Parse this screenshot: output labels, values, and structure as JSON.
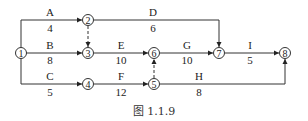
{
  "caption": "图 1.1.9",
  "nodes": [
    {
      "id": "1",
      "label": "1",
      "x": 21,
      "y": 53
    },
    {
      "id": "2",
      "label": "2",
      "x": 88,
      "y": 20
    },
    {
      "id": "3",
      "label": "3",
      "x": 88,
      "y": 53
    },
    {
      "id": "4",
      "label": "4",
      "x": 88,
      "y": 84
    },
    {
      "id": "5",
      "label": "5",
      "x": 154,
      "y": 84
    },
    {
      "id": "6",
      "label": "6",
      "x": 154,
      "y": 53
    },
    {
      "id": "7",
      "label": "7",
      "x": 219,
      "y": 53
    },
    {
      "id": "8",
      "label": "8",
      "x": 285,
      "y": 53
    }
  ],
  "activities": [
    {
      "name": "A",
      "duration": "4",
      "from": "1",
      "to": "2"
    },
    {
      "name": "B",
      "duration": "8",
      "from": "1",
      "to": "3"
    },
    {
      "name": "C",
      "duration": "5",
      "from": "1",
      "to": "4"
    },
    {
      "name": "D",
      "duration": "6",
      "from": "2",
      "to": "7"
    },
    {
      "name": "E",
      "duration": "10",
      "from": "3",
      "to": "6"
    },
    {
      "name": "F",
      "duration": "12",
      "from": "4",
      "to": "5"
    },
    {
      "name": "G",
      "duration": "10",
      "from": "6",
      "to": "7"
    },
    {
      "name": "H",
      "duration": "8",
      "from": "5",
      "to": "8"
    },
    {
      "name": "I",
      "duration": "5",
      "from": "7",
      "to": "8"
    }
  ],
  "dummies": [
    {
      "from": "2",
      "to": "3"
    },
    {
      "from": "5",
      "to": "6"
    }
  ]
}
